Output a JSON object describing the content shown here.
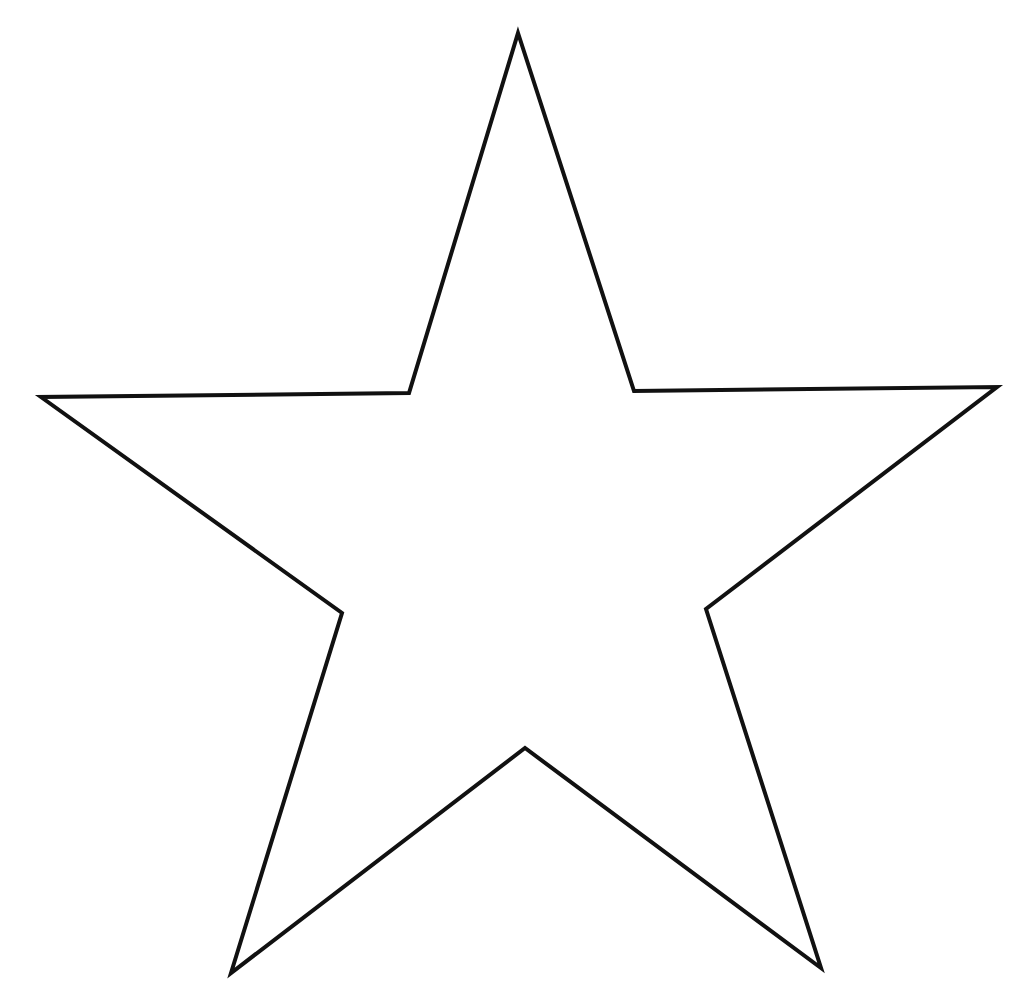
{
  "shape": {
    "type": "five-point-star",
    "fill": "#ffffff",
    "stroke": "#111111",
    "stroke_width": 4,
    "points": [
      [
        518,
        33
      ],
      [
        634,
        391
      ],
      [
        997,
        387
      ],
      [
        706,
        609
      ],
      [
        821,
        968
      ],
      [
        525,
        748
      ],
      [
        231,
        973
      ],
      [
        342,
        613
      ],
      [
        41,
        397
      ],
      [
        409,
        393
      ]
    ]
  }
}
